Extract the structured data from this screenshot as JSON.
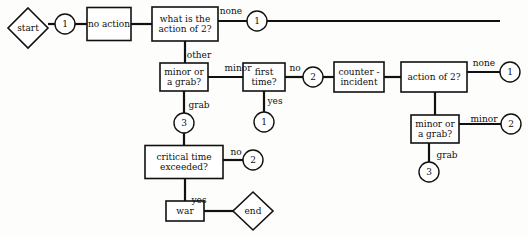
{
  "diagram": {
    "type": "flowchart",
    "background_color": "#fdfdfb",
    "line_color": "#111111",
    "node_fill": "#ffffff",
    "nodes": [
      {
        "id": "start",
        "shape": "diamond",
        "label": "start",
        "x": 28,
        "y": 28,
        "w": 40,
        "h": 40
      },
      {
        "id": "conn-1-a",
        "shape": "circle",
        "label": "1",
        "x": 65,
        "y": 24,
        "r": 10
      },
      {
        "id": "no-action",
        "shape": "rect",
        "label": "no action",
        "x": 109,
        "y": 24,
        "w": 44,
        "h": 33
      },
      {
        "id": "what-action-of-2",
        "shape": "rect",
        "label": "what is the\naction of 2?",
        "x": 185,
        "y": 24,
        "w": 66,
        "h": 34
      },
      {
        "id": "conn-1-b",
        "shape": "circle",
        "label": "1",
        "x": 257,
        "y": 21,
        "r": 10
      },
      {
        "id": "minor-or-grab-l",
        "shape": "rect",
        "label": "minor or\na grab?",
        "x": 184,
        "y": 77,
        "w": 48,
        "h": 28
      },
      {
        "id": "first-time",
        "shape": "rect",
        "label": "first\ntime?",
        "x": 264,
        "y": 77,
        "w": 42,
        "h": 28
      },
      {
        "id": "conn-2-a",
        "shape": "circle",
        "label": "2",
        "x": 313,
        "y": 77,
        "r": 10
      },
      {
        "id": "conn-1-c",
        "shape": "circle",
        "label": "1",
        "x": 264,
        "y": 122,
        "r": 10
      },
      {
        "id": "counter-incident",
        "shape": "rect",
        "label": "counter -\nincident",
        "x": 359,
        "y": 77,
        "w": 50,
        "h": 30
      },
      {
        "id": "action-of-2",
        "shape": "rect",
        "label": "action of 2?",
        "x": 434,
        "y": 77,
        "w": 66,
        "h": 30
      },
      {
        "id": "conn-1-d",
        "shape": "circle",
        "label": "1",
        "x": 510,
        "y": 72,
        "r": 10
      },
      {
        "id": "minor-or-grab-r",
        "shape": "rect",
        "label": "minor or\na grab?",
        "x": 435,
        "y": 129,
        "w": 48,
        "h": 28
      },
      {
        "id": "conn-2-b",
        "shape": "circle",
        "label": "2",
        "x": 511,
        "y": 124,
        "r": 10
      },
      {
        "id": "conn-3-b",
        "shape": "circle",
        "label": "3",
        "x": 429,
        "y": 172,
        "r": 10
      },
      {
        "id": "conn-3-a",
        "shape": "circle",
        "label": "3",
        "x": 184,
        "y": 123,
        "r": 10
      },
      {
        "id": "critical-time",
        "shape": "rect",
        "label": "critical time\nexceeded?",
        "x": 184,
        "y": 162,
        "w": 78,
        "h": 33
      },
      {
        "id": "conn-2-c",
        "shape": "circle",
        "label": "2",
        "x": 253,
        "y": 160,
        "r": 10
      },
      {
        "id": "war",
        "shape": "rect",
        "label": "war",
        "x": 185,
        "y": 211,
        "w": 38,
        "h": 20
      },
      {
        "id": "end",
        "shape": "diamond",
        "label": "end",
        "x": 253,
        "y": 211,
        "w": 40,
        "h": 38
      }
    ],
    "edge_labels": [
      {
        "id": "lbl-none-1",
        "text": "none",
        "x": 231,
        "y": 11
      },
      {
        "id": "lbl-other",
        "text": "other",
        "x": 199,
        "y": 55
      },
      {
        "id": "lbl-minor-l",
        "text": "minor",
        "x": 238,
        "y": 68
      },
      {
        "id": "lbl-no-1",
        "text": "no",
        "x": 295,
        "y": 68
      },
      {
        "id": "lbl-yes-1",
        "text": "yes",
        "x": 275,
        "y": 101
      },
      {
        "id": "lbl-grab-l",
        "text": "grab",
        "x": 199,
        "y": 105
      },
      {
        "id": "lbl-none-2",
        "text": "none",
        "x": 484,
        "y": 63
      },
      {
        "id": "lbl-minor-r",
        "text": "minor",
        "x": 484,
        "y": 119
      },
      {
        "id": "lbl-grab-r",
        "text": "grab",
        "x": 447,
        "y": 155
      },
      {
        "id": "lbl-no-2",
        "text": "no",
        "x": 236,
        "y": 152
      },
      {
        "id": "lbl-yes-2",
        "text": "yes",
        "x": 199,
        "y": 200
      }
    ],
    "edges": [
      {
        "id": "e-start-1",
        "from": "start",
        "to": "conn-1-a",
        "path": "M48,24 L55,24"
      },
      {
        "id": "e-1-noaction",
        "from": "conn-1-a",
        "to": "no-action",
        "path": "M75,24 L87,24"
      },
      {
        "id": "e-noaction-what",
        "from": "no-action",
        "to": "what-action-of-2",
        "path": "M131,24 L152,24"
      },
      {
        "id": "e-what-none",
        "from": "what-action-of-2",
        "to": "conn-1-b",
        "path": "M218,21 L500,21"
      },
      {
        "id": "e-what-other",
        "from": "what-action-of-2",
        "to": "minor-or-grab-l",
        "path": "M185,41 L185,63"
      },
      {
        "id": "e-mg-minor",
        "from": "minor-or-grab-l",
        "to": "first-time",
        "path": "M208,77 L243,77"
      },
      {
        "id": "e-ft-no",
        "from": "first-time",
        "to": "conn-2-a",
        "path": "M285,77 L303,77"
      },
      {
        "id": "e-2-counter",
        "from": "conn-2-a",
        "to": "counter-incident",
        "path": "M323,77 L335,77"
      },
      {
        "id": "e-counter-act",
        "from": "counter-incident",
        "to": "action-of-2",
        "path": "M384,77 L401,77"
      },
      {
        "id": "e-ft-yes",
        "from": "first-time",
        "to": "conn-1-c",
        "path": "M264,91 L264,112"
      },
      {
        "id": "e-mg-grab",
        "from": "minor-or-grab-l",
        "to": "conn-3-a",
        "path": "M184,91 L184,113"
      },
      {
        "id": "e-3-crit",
        "from": "conn-3-a",
        "to": "critical-time",
        "path": "M184,133 L184,146"
      },
      {
        "id": "e-crit-no",
        "from": "critical-time",
        "to": "conn-2-c",
        "path": "M223,160 L243,160"
      },
      {
        "id": "e-crit-yes",
        "from": "critical-time",
        "to": "war",
        "path": "M185,179 L185,201"
      },
      {
        "id": "e-war-end",
        "from": "war",
        "to": "end",
        "path": "M204,211 L234,211"
      },
      {
        "id": "e-act-none",
        "from": "action-of-2",
        "to": "conn-1-d",
        "path": "M467,72 L500,72"
      },
      {
        "id": "e-act-mg",
        "from": "action-of-2",
        "to": "minor-or-grab-r",
        "path": "M435,92 L435,115"
      },
      {
        "id": "e-mgr-minor",
        "from": "minor-or-grab-r",
        "to": "conn-2-b",
        "path": "M459,124 L501,124"
      },
      {
        "id": "e-mgr-grab",
        "from": "minor-or-grab-r",
        "to": "conn-3-b",
        "path": "M429,143 L429,162"
      }
    ]
  }
}
